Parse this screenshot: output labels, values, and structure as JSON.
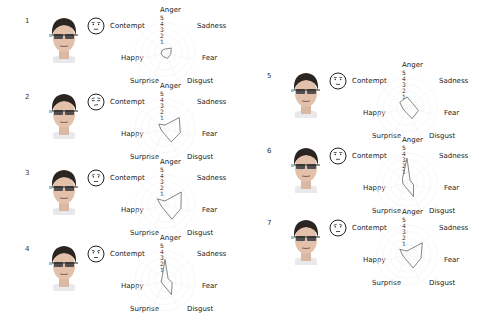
{
  "figure": {
    "axes": [
      "Anger",
      "Sadness",
      "Fear",
      "Disgust",
      "Surprise",
      "Happy",
      "Contempt"
    ],
    "scale_ticks": [
      "5",
      "4",
      "3",
      "2",
      "1"
    ],
    "line_color": "#777777",
    "grid_color": "#f2f2f2"
  },
  "panels": [
    {
      "id": "1",
      "label": "1",
      "emoticon": "neutral",
      "values": [
        1,
        1.6,
        1.3,
        1.3,
        1,
        1,
        1
      ]
    },
    {
      "id": "2",
      "label": "2",
      "emoticon": "contempt",
      "values": [
        1,
        3.2,
        2.8,
        2.6,
        1,
        1,
        1.6
      ]
    },
    {
      "id": "3",
      "label": "3",
      "emoticon": "neutral-down",
      "values": [
        1,
        3.6,
        2.9,
        2.8,
        1,
        1,
        1.9
      ]
    },
    {
      "id": "4",
      "label": "4",
      "emoticon": "angry",
      "values": [
        3.7,
        1,
        1.5,
        2.7,
        1,
        1,
        1
      ]
    },
    {
      "id": "5",
      "label": "5",
      "emoticon": "neutral",
      "values": [
        2.1,
        1.5,
        2.2,
        2.2,
        1,
        1,
        1.8
      ]
    },
    {
      "id": "6",
      "label": "6",
      "emoticon": "neutral",
      "values": [
        4.2,
        1,
        1.4,
        2.7,
        1,
        1,
        1.3
      ]
    },
    {
      "id": "7",
      "label": "7",
      "emoticon": "neutral-down",
      "values": [
        1,
        3.4,
        2.6,
        2.6,
        1,
        1,
        1.8
      ]
    }
  ],
  "chart_data": {
    "type": "radar",
    "title": "",
    "categories": [
      "Anger",
      "Sadness",
      "Fear",
      "Disgust",
      "Surprise",
      "Happy",
      "Contempt"
    ],
    "rlim": [
      1,
      5
    ],
    "grid": true,
    "series": [
      {
        "name": "1",
        "values": [
          1,
          1.6,
          1.3,
          1.3,
          1,
          1,
          1
        ]
      },
      {
        "name": "2",
        "values": [
          1,
          3.2,
          2.8,
          2.6,
          1,
          1,
          1.6
        ]
      },
      {
        "name": "3",
        "values": [
          1,
          3.6,
          2.9,
          2.8,
          1,
          1,
          1.9
        ]
      },
      {
        "name": "4",
        "values": [
          3.7,
          1,
          1.5,
          2.7,
          1,
          1,
          1
        ]
      },
      {
        "name": "5",
        "values": [
          2.1,
          1.5,
          2.2,
          2.2,
          1,
          1,
          1.8
        ]
      },
      {
        "name": "6",
        "values": [
          4.2,
          1,
          1.4,
          2.7,
          1,
          1,
          1.3
        ]
      },
      {
        "name": "7",
        "values": [
          1,
          3.4,
          2.6,
          2.6,
          1,
          1,
          1.8
        ]
      }
    ]
  }
}
